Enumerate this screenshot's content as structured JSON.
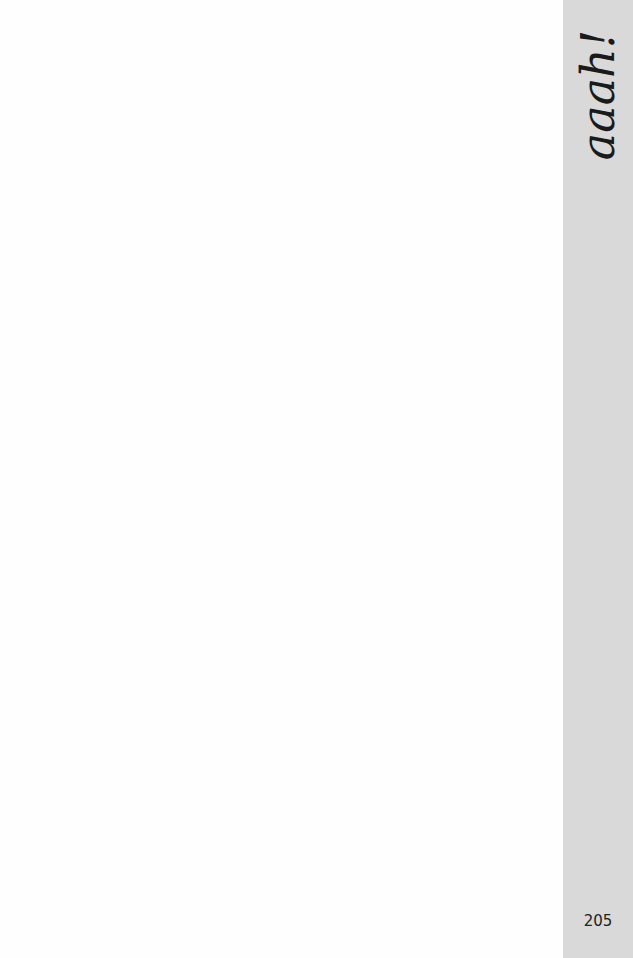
{
  "page": {
    "side_tab": {
      "title": "aaah!",
      "background": "#d9d9d9"
    },
    "page_number": "205"
  }
}
